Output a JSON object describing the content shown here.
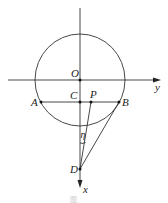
{
  "figure": {
    "type": "geometry-diagram",
    "axes": {
      "horizontal_label": "y",
      "vertical_label": "x"
    },
    "circle": {
      "center": "O"
    },
    "points": {
      "O": {
        "label": "O"
      },
      "A": {
        "label": "A"
      },
      "B": {
        "label": "B"
      },
      "C": {
        "label": "C"
      },
      "P": {
        "label": "P"
      },
      "D": {
        "label": "D"
      }
    },
    "angle_label": "η",
    "segments": [
      "AB",
      "PD",
      "BD",
      "CD"
    ],
    "caption": "图"
  }
}
